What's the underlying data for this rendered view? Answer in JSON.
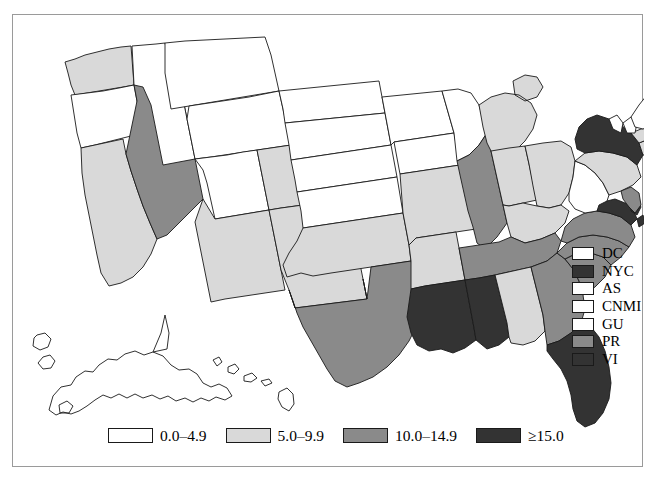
{
  "chart_data": {
    "type": "map",
    "title": "",
    "map_region": "United States",
    "value_unit": "rate per 100,000",
    "legend_position": "bottom-center",
    "rate_legend": [
      {
        "label": "0.0–4.9",
        "color": "#ffffff",
        "bin": 0
      },
      {
        "label": "5.0–9.9",
        "color": "#d9d9d9",
        "bin": 1
      },
      {
        "label": "10.0–14.9",
        "color": "#8a8a8a",
        "bin": 2
      },
      {
        "label": "≥15.0",
        "color": "#333333",
        "bin": 3
      }
    ],
    "territory_legend": [
      {
        "label": "DC",
        "color": "#ffffff",
        "bin": 0
      },
      {
        "label": "NYC",
        "color": "#333333",
        "bin": 3
      },
      {
        "label": "AS",
        "color": "#ffffff",
        "bin": 0
      },
      {
        "label": "CNMI",
        "color": "#ffffff",
        "bin": 0
      },
      {
        "label": "GU",
        "color": "#ffffff",
        "bin": 0
      },
      {
        "label": "PR",
        "color": "#8a8a8a",
        "bin": 2
      },
      {
        "label": "VI",
        "color": "#333333",
        "bin": 3
      }
    ],
    "states": [
      {
        "code": "AL",
        "bin": 1
      },
      {
        "code": "AK",
        "bin": 0
      },
      {
        "code": "AZ",
        "bin": 1
      },
      {
        "code": "AR",
        "bin": 1
      },
      {
        "code": "CA",
        "bin": 1
      },
      {
        "code": "CO",
        "bin": 1
      },
      {
        "code": "CT",
        "bin": 1
      },
      {
        "code": "DE",
        "bin": 3
      },
      {
        "code": "FL",
        "bin": 3
      },
      {
        "code": "GA",
        "bin": 2
      },
      {
        "code": "HI",
        "bin": 0
      },
      {
        "code": "ID",
        "bin": 0
      },
      {
        "code": "IL",
        "bin": 2
      },
      {
        "code": "IN",
        "bin": 1
      },
      {
        "code": "IA",
        "bin": 0
      },
      {
        "code": "KS",
        "bin": 0
      },
      {
        "code": "KY",
        "bin": 1
      },
      {
        "code": "LA",
        "bin": 3
      },
      {
        "code": "ME",
        "bin": 0
      },
      {
        "code": "MD",
        "bin": 3
      },
      {
        "code": "MA",
        "bin": 1
      },
      {
        "code": "MI",
        "bin": 1
      },
      {
        "code": "MN",
        "bin": 0
      },
      {
        "code": "MS",
        "bin": 3
      },
      {
        "code": "MO",
        "bin": 1
      },
      {
        "code": "MT",
        "bin": 0
      },
      {
        "code": "NE",
        "bin": 0
      },
      {
        "code": "NV",
        "bin": 2
      },
      {
        "code": "NH",
        "bin": 0
      },
      {
        "code": "NJ",
        "bin": 2
      },
      {
        "code": "NM",
        "bin": 1
      },
      {
        "code": "NY",
        "bin": 3
      },
      {
        "code": "NC",
        "bin": 2
      },
      {
        "code": "ND",
        "bin": 0
      },
      {
        "code": "OH",
        "bin": 1
      },
      {
        "code": "OK",
        "bin": 1
      },
      {
        "code": "OR",
        "bin": 0
      },
      {
        "code": "PA",
        "bin": 1
      },
      {
        "code": "RI",
        "bin": 1
      },
      {
        "code": "SC",
        "bin": 2
      },
      {
        "code": "SD",
        "bin": 0
      },
      {
        "code": "TN",
        "bin": 2
      },
      {
        "code": "TX",
        "bin": 2
      },
      {
        "code": "UT",
        "bin": 0
      },
      {
        "code": "VT",
        "bin": 0
      },
      {
        "code": "VA",
        "bin": 2
      },
      {
        "code": "WA",
        "bin": 1
      },
      {
        "code": "WV",
        "bin": 0
      },
      {
        "code": "WI",
        "bin": 0
      },
      {
        "code": "WY",
        "bin": 0
      }
    ]
  }
}
